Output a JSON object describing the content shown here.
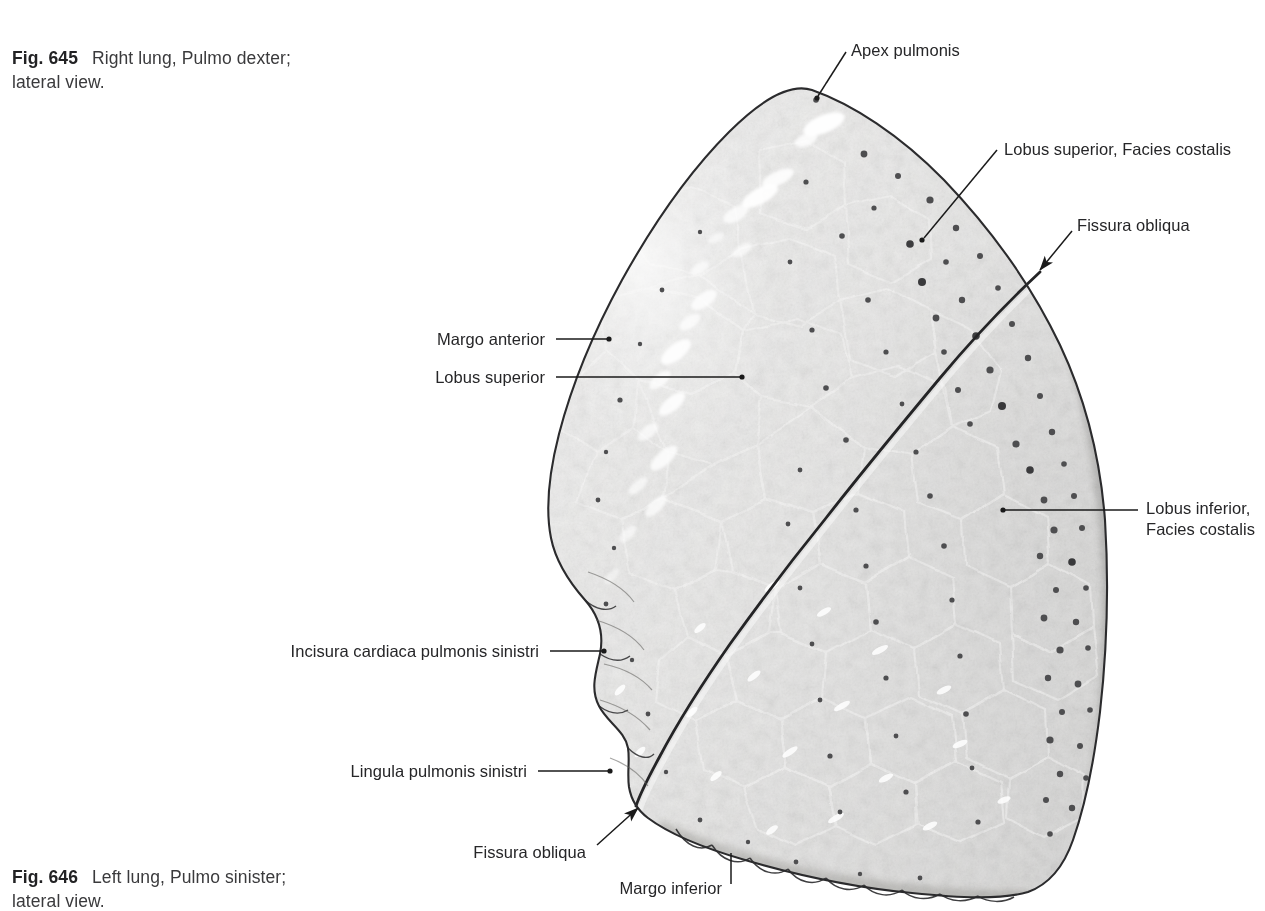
{
  "page": {
    "background": "#ffffff",
    "text_color": "#262628",
    "leader_color": "#1a1a1a",
    "width": 1265,
    "height": 904
  },
  "captions": [
    {
      "id": "caption-645",
      "fig_number": "Fig. 645",
      "text": "Right lung, Pulmo dexter;\nlateral view."
    },
    {
      "id": "caption-646",
      "fig_number": "Fig. 646",
      "text": "Left lung, Pulmo sinister;\nlateral view."
    }
  ],
  "figure": {
    "name": "left-lung-lateral-view",
    "tones": {
      "parenchyma_light": "#c9c8c6",
      "parenchyma_mid": "#a6a5a3",
      "parenchyma_dark": "#7e7d7b",
      "outline": "#2e2e30",
      "fissure": "#1f1f21",
      "highlight": "#ffffff",
      "anthracosis_spot": "#4a4a4c"
    }
  },
  "labels": [
    {
      "id": "apex-pulmonis",
      "name": "apex-pulmonis",
      "text": "Apex pulmonis",
      "align": "left",
      "x": 851,
      "y": 40,
      "leader": "line",
      "leader_from": [
        846,
        52
      ],
      "leader_to": [
        817,
        98
      ]
    },
    {
      "id": "lobus-superior-facies-costalis",
      "name": "lobus-superior-facies-costalis",
      "text": "Lobus superior, Facies costalis",
      "align": "left",
      "x": 1004,
      "y": 139,
      "leader": "line",
      "leader_from": [
        997,
        150
      ],
      "leader_to": [
        922,
        240
      ]
    },
    {
      "id": "fissura-obliqua-top",
      "name": "fissura-obliqua-superior",
      "text": "Fissura obliqua",
      "align": "left",
      "x": 1077,
      "y": 215,
      "leader": "arrow",
      "leader_from": [
        1072,
        231
      ],
      "leader_to": [
        1037,
        273
      ]
    },
    {
      "id": "lobus-inferior-facies-costalis",
      "name": "lobus-inferior-facies-costalis",
      "text": "Lobus inferior,\nFacies costalis",
      "align": "left",
      "x": 1146,
      "y": 498,
      "leader": "line",
      "leader_from": [
        1138,
        510
      ],
      "leader_to": [
        1003,
        510
      ]
    },
    {
      "id": "margo-anterior",
      "name": "margo-anterior",
      "text": "Margo anterior",
      "align": "right",
      "x": 545,
      "y": 329,
      "leader": "line",
      "leader_from": [
        556,
        339
      ],
      "leader_to": [
        609,
        339
      ]
    },
    {
      "id": "lobus-superior",
      "name": "lobus-superior",
      "text": "Lobus superior",
      "align": "right",
      "x": 545,
      "y": 367,
      "leader": "line",
      "leader_from": [
        556,
        377
      ],
      "leader_to": [
        742,
        377
      ]
    },
    {
      "id": "incisura-cardiaca-pulmonis-sinistri",
      "name": "incisura-cardiaca-pulmonis-sinistri",
      "text": "Incisura cardiaca pulmonis sinistri",
      "align": "right",
      "x": 539,
      "y": 641,
      "leader": "line",
      "leader_from": [
        550,
        651
      ],
      "leader_to": [
        604,
        651
      ]
    },
    {
      "id": "lingula-pulmonis-sinistri",
      "name": "lingula-pulmonis-sinistri",
      "text": "Lingula pulmonis sinistri",
      "align": "right",
      "x": 527,
      "y": 761,
      "leader": "line",
      "leader_from": [
        538,
        771
      ],
      "leader_to": [
        610,
        771
      ]
    },
    {
      "id": "fissura-obliqua-bottom",
      "name": "fissura-obliqua-inferior",
      "text": "Fissura obliqua",
      "align": "right",
      "x": 586,
      "y": 842,
      "leader": "arrow",
      "leader_from": [
        597,
        845
      ],
      "leader_to": [
        636,
        806
      ]
    },
    {
      "id": "margo-inferior",
      "name": "margo-inferior",
      "text": "Margo inferior",
      "align": "right",
      "x": 723,
      "y": 878,
      "leader": "line",
      "leader_from": [
        731,
        884
      ],
      "leader_to": [
        731,
        853
      ]
    }
  ]
}
